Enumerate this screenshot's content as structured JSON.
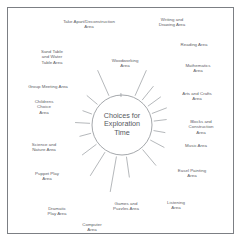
{
  "diagram": {
    "title": "Choices for Exploration Time",
    "hub": {
      "text": "Choices for\nExploration\nTime",
      "center_x": 122,
      "center_y": 125,
      "radius": 30
    },
    "style": {
      "background": "#ffffff",
      "border_color": "#7c7f84",
      "line_color": "#8d9196",
      "circle_color": "#8d9196",
      "text_color": "#5d6166",
      "hub_text_color": "#55595e"
    },
    "nodes": [
      {
        "label": "Writing and\nDrawing Area",
        "angle": 66,
        "label_x": 172,
        "label_y": 22,
        "spoke_outer": 60
      },
      {
        "label": "Reading Area",
        "angle": 51,
        "label_x": 194,
        "label_y": 45,
        "spoke_outer": 50
      },
      {
        "label": "Mathematics\nArea",
        "angle": 36,
        "label_x": 198,
        "label_y": 68,
        "spoke_outer": 48
      },
      {
        "label": "Arts and Crafts\nArea",
        "angle": 21,
        "label_x": 197,
        "label_y": 96,
        "spoke_outer": 48
      },
      {
        "label": "Blocks and\nConstruction\nArea",
        "angle": 7,
        "label_x": 201,
        "label_y": 127,
        "spoke_outer": 45
      },
      {
        "label": "Music Area",
        "angle": -10,
        "label_x": 196,
        "label_y": 146,
        "spoke_outer": 44
      },
      {
        "label": "Easel Painting\nArea",
        "angle": -28,
        "label_x": 192,
        "label_y": 173,
        "spoke_outer": 48
      },
      {
        "label": "Listening\nArea",
        "angle": -50,
        "label_x": 176,
        "label_y": 205,
        "spoke_outer": 53
      },
      {
        "label": "Games and\nPuzzles Area",
        "angle": -82,
        "label_x": 126,
        "label_y": 206,
        "spoke_outer": 53
      },
      {
        "label": "Computer\nArea",
        "angle": -100,
        "label_x": 92,
        "label_y": 227,
        "spoke_outer": 68
      },
      {
        "label": "Dramatic\nPlay Area",
        "angle": -122,
        "label_x": 57,
        "label_y": 211,
        "spoke_outer": 60
      },
      {
        "label": "Puppet Play\nArea",
        "angle": -143,
        "label_x": 47,
        "label_y": 176,
        "spoke_outer": 50
      },
      {
        "label": "Science and\nNature Area",
        "angle": -165,
        "label_x": 44,
        "label_y": 147,
        "spoke_outer": 44
      },
      {
        "label": "Childrens\nChoice\nArea",
        "angle": 177,
        "label_x": 44,
        "label_y": 107,
        "spoke_outer": 47
      },
      {
        "label": "Group Meeting Area",
        "angle": 160,
        "label_x": 48,
        "label_y": 87,
        "spoke_outer": 42
      },
      {
        "label": "Sand Table\nand Water\nTable Area",
        "angle": 140,
        "label_x": 52,
        "label_y": 57,
        "spoke_outer": 46
      },
      {
        "label": "Take Apart/Deconstruction\nArea",
        "angle": 114,
        "label_x": 89,
        "label_y": 24,
        "spoke_outer": 60
      },
      {
        "label": "Woodworking\nArea",
        "angle": 92,
        "label_x": 125,
        "label_y": 63,
        "spoke_outer": 28
      }
    ]
  }
}
